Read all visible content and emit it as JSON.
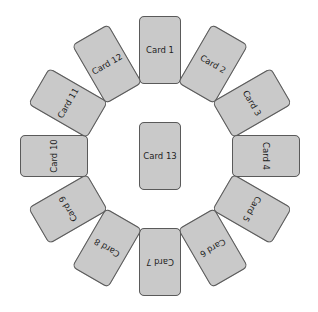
{
  "diagram": {
    "center": {
      "x": 160,
      "y": 156
    },
    "radius": 106,
    "colors": {
      "card_fill": "#c9c9c9",
      "card_border": "#5a5a5a",
      "text": "#1e1e1e",
      "background": "#ffffff"
    },
    "ring_cards": [
      {
        "label": "Card 1",
        "angle": 0
      },
      {
        "label": "Card 2",
        "angle": 30
      },
      {
        "label": "Card 3",
        "angle": 60
      },
      {
        "label": "Card 4",
        "angle": 90
      },
      {
        "label": "Card 5",
        "angle": 120
      },
      {
        "label": "Card 6",
        "angle": 150
      },
      {
        "label": "Card 7",
        "angle": 180
      },
      {
        "label": "Card 8",
        "angle": 210
      },
      {
        "label": "Card 9",
        "angle": 240
      },
      {
        "label": "Card 10",
        "angle": 270
      },
      {
        "label": "Card 11",
        "angle": 300
      },
      {
        "label": "Card 12",
        "angle": 330
      }
    ],
    "center_card": {
      "label": "Card 13"
    }
  }
}
